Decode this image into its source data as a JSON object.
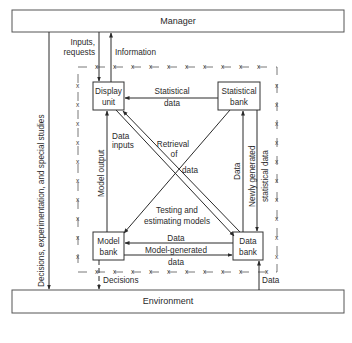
{
  "diagram": {
    "nodes": {
      "manager": "Manager",
      "environment": "Environment",
      "display_unit": [
        "Display",
        "unit"
      ],
      "statistical_bank": [
        "Statistical",
        "bank"
      ],
      "model_bank": [
        "Model",
        "bank"
      ],
      "data_bank": [
        "Data",
        "bank"
      ]
    },
    "edges": {
      "inputs_requests": [
        "Inputs,",
        "requests"
      ],
      "information": "Information",
      "decisions_experimentation": "Decisions, experimentation, and special studies",
      "statistical_data": [
        "Statistical",
        "data"
      ],
      "model_output": "Model output",
      "data_inputs": [
        "Data",
        "inputs"
      ],
      "retrieval_of_data": [
        "Retrieval",
        "of",
        "data"
      ],
      "testing_estimating": [
        "Testing and",
        "estimating models"
      ],
      "data_left": "Data",
      "newly_generated": [
        "Newly generated",
        "statistical data"
      ],
      "data_model": "Data",
      "model_generated": [
        "Model-generated",
        "data"
      ],
      "decisions": "Decisions",
      "data_env": "Data"
    },
    "boundary_marker": "x",
    "colors": {
      "line": "#2a2a2a",
      "background": "#ffffff"
    }
  }
}
